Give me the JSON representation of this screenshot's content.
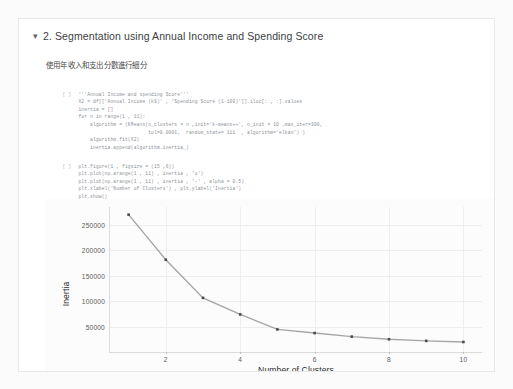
{
  "notebook": {
    "section": {
      "caret_icon": "chevron-down-icon",
      "title": "2. Segmentation using Annual Income and Spending Score"
    },
    "note_cn": "使用年收入和支出分數進行細分",
    "cells": [
      {
        "prompt": "[ ]",
        "code": "'''Annual Income and spending Score'''\nX2 = df[['Annual Income (k$)' , 'Spending Score (1-100)']].iloc[: , :].values\ninertia = []\nfor n in range(1 , 11):\n    algorithm = (KMeans(n_clusters = n ,init='k-means++', n_init = 10 ,max_iter=300,\n                        tol=0.0001,  random_state= 111  , algorithm='elkan') )\n    algorithm.fit(X2)\n    inertia.append(algorithm.inertia_)"
      },
      {
        "prompt": "[ ]",
        "code": "plt.figure(1 , figsize = (15 ,6))\nplt.plot(np.arange(1 , 11) , inertia , 'o')\nplt.plot(np.arange(1 , 11) , inertia , '-' , alpha = 0.5)\nplt.xlabel('Number of Clusters') , plt.ylabel('Inertia')\nplt.show()"
      }
    ]
  },
  "chart_data": {
    "type": "line",
    "title": "",
    "xlabel": "Number of Clusters",
    "ylabel": "Inertia",
    "x": [
      1,
      2,
      3,
      4,
      5,
      6,
      7,
      8,
      9,
      10
    ],
    "values": [
      269981,
      181363,
      106348,
      73880,
      44448,
      37233,
      30259,
      25012,
      21850,
      19672
    ],
    "xlim": [
      0.5,
      10.5
    ],
    "ylim": [
      0,
      285000
    ],
    "xticks": [
      2,
      4,
      6,
      8,
      10
    ],
    "xtick_labels": [
      "2",
      "4",
      "6",
      "8",
      "10"
    ],
    "yticks": [
      50000,
      100000,
      150000,
      200000,
      250000
    ],
    "ytick_labels": [
      "50000",
      "100000",
      "150000",
      "200000",
      "250000"
    ],
    "grid": true,
    "legend": "none",
    "marker": "o",
    "line_color": "#8a8a8a",
    "marker_color": "#4a4a4a"
  }
}
